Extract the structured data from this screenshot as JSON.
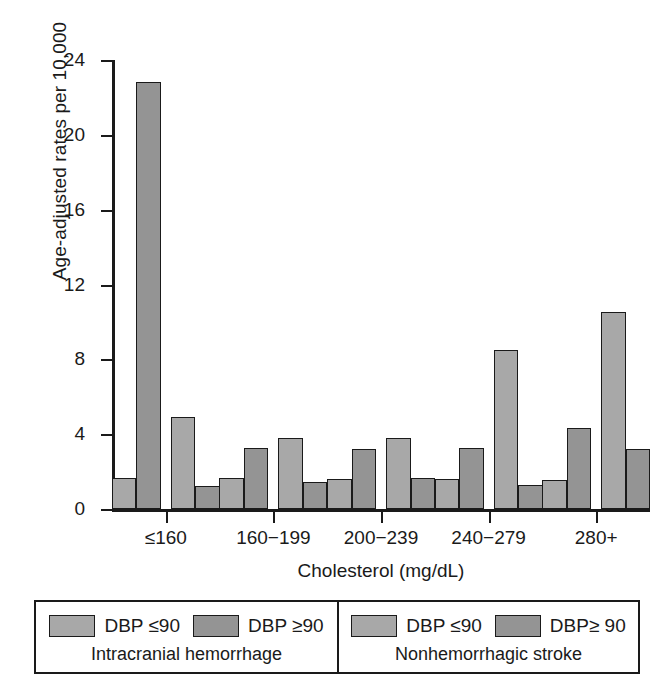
{
  "chart_data": {
    "type": "bar",
    "title": "",
    "xlabel": "Cholesterol (mg/dL)",
    "ylabel": "Age-adjusted rates per 10,000",
    "categories": [
      "≤160",
      "160−199",
      "200−239",
      "240−279",
      "280+"
    ],
    "yticks": [
      0,
      4,
      8,
      12,
      16,
      20,
      24
    ],
    "ylim": [
      0,
      24
    ],
    "grid": false,
    "legend_position": "below-axis",
    "series": [
      {
        "name": "Intracranial hemorrhage — DBP ≤90",
        "color": "#a8a8a8",
        "values": [
          1.65,
          1.65,
          1.6,
          1.6,
          1.55
        ]
      },
      {
        "name": "Intracranial hemorrhage — DBP ≥90",
        "color": "#949494",
        "values": [
          22.8,
          3.25,
          3.2,
          3.25,
          4.35
        ]
      },
      {
        "name": "Nonhemorrhagic stroke — DBP ≤90",
        "color": "#a8a8a8",
        "values": [
          4.9,
          3.8,
          3.8,
          8.5,
          10.55
        ]
      },
      {
        "name": "Nonhemorrhagic stroke — DBP≥ 90",
        "color": "#949494",
        "values": [
          1.25,
          1.45,
          1.65,
          1.3,
          3.2
        ]
      }
    ]
  },
  "legend": {
    "panels": [
      {
        "caption": "Intracranial hemorrhage",
        "entries": [
          {
            "label": "DBP ≤90",
            "color": "#a8a8a8"
          },
          {
            "label": "DBP ≥90",
            "color": "#949494"
          }
        ]
      },
      {
        "caption": "Nonhemorrhagic stroke",
        "entries": [
          {
            "label": "DBP ≤90",
            "color": "#a8a8a8"
          },
          {
            "label": "DBP≥ 90",
            "color": "#949494"
          }
        ]
      }
    ]
  }
}
